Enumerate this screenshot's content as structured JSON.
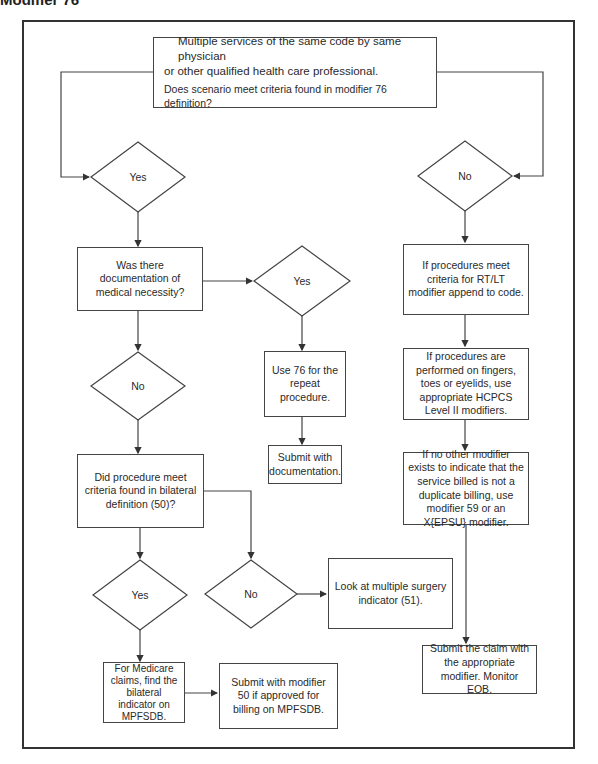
{
  "title": "Modifier 76",
  "flowchart": {
    "start": {
      "line1": "Multiple services of the same code by same physician",
      "line2": "or other qualified health care professional.",
      "question": "Does scenario meet criteria found in modifier 76 definition?"
    },
    "decision_yes_1": "Yes",
    "decision_no_1": "No",
    "documentation_question": "Was there documentation of medical necessity?",
    "decision_yes_doc": "Yes",
    "use76": "Use 76 for the repeat procedure.",
    "submit_docs": "Submit with documentation.",
    "decision_no_doc": "No",
    "bilateral_question": "Did procedure meet criteria found in bilateral definition (50)?",
    "decision_yes_bilateral": "Yes",
    "decision_no_bilateral": "No",
    "multiple_surgery": "Look at multiple surgery indicator (51).",
    "medicare": "For Medicare claims, find the bilateral indicator on MPFSDB.",
    "submit50": "Submit with modifier 50 if approved for billing on MPFSDB.",
    "rtlt": "If procedures meet criteria for RT/LT modifier append to code.",
    "fingers": "If procedures are performed on fingers, toes or eyelids, use appropriate HCPCS Level II modifiers.",
    "no_other": "If no other modifier exists to indicate that the service billed is not a duplicate billing, use modifier 59 or an X{EPSU} modifier.",
    "submit_claim": "Submit the claim with the appropriate modifier.  Monitor EOB."
  }
}
